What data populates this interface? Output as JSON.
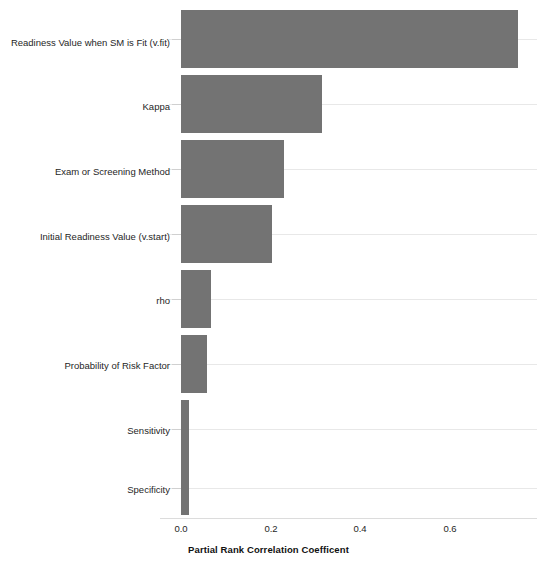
{
  "chart_data": {
    "type": "bar",
    "orientation": "horizontal",
    "title": "",
    "subtitle": "",
    "xlabel": "Partial Rank Correlation Coefficent",
    "ylabel": "",
    "xlim": [
      0.0,
      0.76
    ],
    "xticks": [
      0.0,
      0.2,
      0.4,
      0.6
    ],
    "xtick_labels": [
      "0.0",
      "0.2",
      "0.4",
      "0.6"
    ],
    "grid": "horizontal",
    "legend": "none",
    "bar_color": "#737373",
    "gridline_color": "#e8e8e8",
    "axis_color": "#dcdcdc",
    "categories": [
      "Readiness Value when SM is Fit (v.fit)",
      "Kappa",
      "Exam or Screening Method",
      "Initial Readiness Value (v.start)",
      "rho",
      "Probability of Risk Factor",
      "Sensitivity",
      "Specificity"
    ],
    "values": [
      0.72,
      0.3,
      0.22,
      0.194,
      0.063,
      0.055,
      0.018,
      0.018
    ]
  }
}
